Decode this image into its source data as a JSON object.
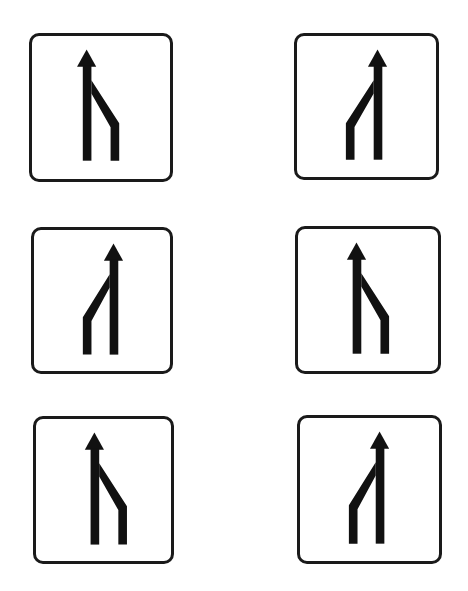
{
  "page": {
    "background": "#ffffff"
  },
  "colors": {
    "border": "#1a1a1a",
    "glyph": "#111111",
    "face": "#ffffff"
  },
  "signs": [
    {
      "id": 1,
      "row": 1,
      "col": 1,
      "variant": "right-lane-ends",
      "description": "Two lanes merge into one; right lane ends, arrow continues straight on left"
    },
    {
      "id": 2,
      "row": 1,
      "col": 2,
      "variant": "left-lane-ends",
      "description": "Two lanes merge into one; left lane ends, arrow continues straight on right"
    },
    {
      "id": 3,
      "row": 2,
      "col": 1,
      "variant": "left-lane-ends",
      "description": "Two lanes merge into one; left lane ends, arrow continues straight on right"
    },
    {
      "id": 4,
      "row": 2,
      "col": 2,
      "variant": "right-lane-ends",
      "description": "Two lanes merge into one; right lane ends, arrow continues straight on left"
    },
    {
      "id": 5,
      "row": 3,
      "col": 1,
      "variant": "right-lane-ends",
      "description": "Two lanes merge into one; right lane ends, arrow continues straight on left"
    },
    {
      "id": 6,
      "row": 3,
      "col": 2,
      "variant": "left-lane-ends",
      "description": "Two lanes merge into one; left lane ends, arrow continues straight on right"
    }
  ]
}
